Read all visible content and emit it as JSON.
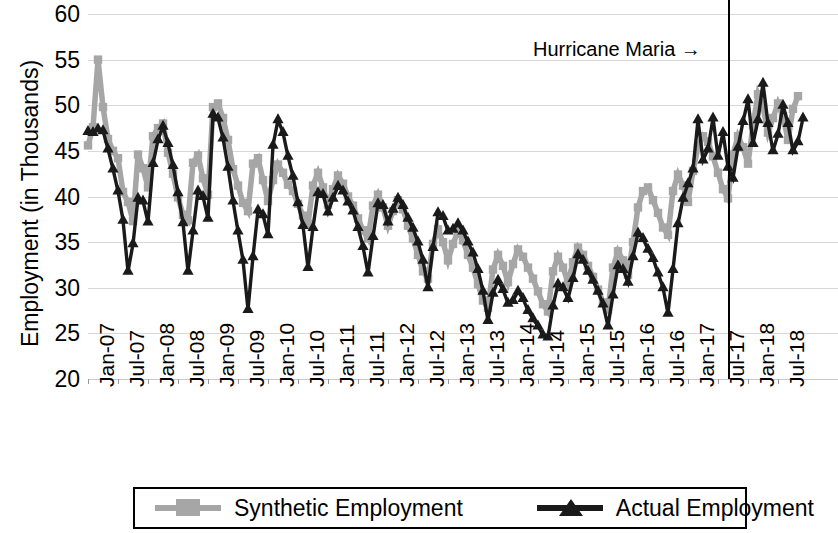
{
  "chart_data": {
    "type": "line",
    "title": "",
    "xlabel": "",
    "ylabel": "Employment (in Thousands)",
    "ylim": [
      20,
      60
    ],
    "yticks": [
      20,
      25,
      30,
      35,
      40,
      45,
      50,
      55,
      60
    ],
    "grid": true,
    "legend_position": "bottom",
    "annotations": [
      {
        "text": "Hurricane Maria →",
        "x": "Sep-17",
        "type": "vertical-line-label"
      }
    ],
    "event_line": {
      "label": "Hurricane Maria",
      "x_index": 128,
      "x_label": "Sep-17"
    },
    "x_tick_labels": [
      "Jan-07",
      "Jul-07",
      "Jan-08",
      "Jul-08",
      "Jan-09",
      "Jul-09",
      "Jan-10",
      "Jul-10",
      "Jan-11",
      "Jul-11",
      "Jan-12",
      "Jul-12",
      "Jan-13",
      "Jul-13",
      "Jan-14",
      "Jul-14",
      "Jan-15",
      "Jul-15",
      "Jan-16",
      "Jul-16",
      "Jan-17",
      "Jul-17",
      "Jan-18",
      "Jul-18"
    ],
    "x_tick_step_months": 6,
    "x_start": "Jan-07",
    "x_end": "Jul-18",
    "n_points": 139,
    "series": [
      {
        "name": "Synthetic Employment",
        "color": "#a6a6a6",
        "marker": "square",
        "values": [
          45.6,
          47.6,
          55.0,
          49.8,
          46.3,
          45.0,
          44.2,
          40.5,
          39.4,
          37.3,
          44.6,
          43.1,
          41.0,
          46.6,
          47.5,
          48.0,
          44.8,
          42.5,
          39.9,
          38.0,
          37.4,
          43.7,
          44.5,
          42.0,
          40.2,
          49.8,
          50.2,
          48.6,
          46.2,
          43.0,
          41.2,
          39.3,
          38.4,
          43.6,
          44.2,
          41.8,
          39.5,
          41.8,
          43.5,
          42.6,
          41.3,
          40.6,
          39.2,
          37.9,
          37.0,
          41.2,
          42.6,
          41.0,
          39.1,
          40.8,
          42.3,
          41.4,
          40.0,
          39.0,
          37.6,
          36.3,
          35.4,
          39.0,
          40.2,
          38.8,
          36.8,
          38.4,
          39.6,
          38.6,
          36.8,
          35.4,
          33.6,
          31.8,
          31.0,
          34.8,
          36.4,
          35.0,
          33.0,
          34.8,
          36.2,
          35.2,
          33.6,
          32.2,
          30.4,
          28.6,
          27.8,
          32.0,
          33.6,
          32.4,
          30.6,
          32.6,
          34.2,
          33.4,
          32.2,
          31.0,
          29.6,
          28.2,
          27.4,
          31.8,
          33.4,
          32.2,
          30.6,
          32.8,
          34.4,
          33.6,
          32.4,
          31.2,
          29.8,
          28.4,
          27.6,
          32.2,
          34.0,
          33.0,
          31.4,
          35.0,
          38.8,
          40.6,
          41.0,
          39.6,
          38.2,
          36.6,
          35.8,
          40.6,
          42.4,
          41.2,
          39.4,
          42.8,
          45.4,
          46.6,
          46.0,
          44.4,
          42.6,
          40.8,
          39.8,
          44.6,
          46.6,
          45.4,
          43.6,
          47.8,
          51.2,
          49.8,
          47.0,
          48.6,
          50.2,
          48.8,
          46.2,
          49.6,
          51.0
        ]
      },
      {
        "name": "Actual Employment",
        "color": "#1a1a1a",
        "marker": "triangle",
        "values": [
          47.1,
          47.0,
          47.4,
          47.2,
          45.2,
          43.0,
          40.6,
          37.4,
          31.8,
          34.8,
          39.8,
          39.5,
          37.2,
          43.6,
          46.2,
          47.7,
          45.8,
          43.4,
          40.4,
          37.1,
          31.8,
          36.2,
          40.6,
          40.0,
          37.6,
          49.0,
          48.6,
          46.4,
          43.2,
          39.5,
          36.2,
          33.0,
          27.6,
          33.4,
          38.5,
          38.0,
          35.8,
          45.6,
          48.4,
          47.0,
          44.4,
          42.2,
          39.3,
          36.8,
          32.2,
          36.6,
          40.4,
          40.2,
          38.3,
          39.8,
          41.1,
          40.6,
          39.4,
          38.4,
          36.6,
          34.5,
          31.6,
          35.6,
          39.2,
          39.0,
          37.2,
          38.6,
          39.8,
          39.0,
          37.6,
          36.5,
          35.0,
          33.0,
          30.0,
          34.4,
          38.2,
          37.8,
          36.2,
          36.4,
          37.0,
          36.2,
          35.0,
          33.8,
          32.0,
          29.6,
          26.4,
          29.4,
          30.8,
          29.8,
          28.3,
          28.6,
          29.6,
          28.8,
          27.5,
          26.6,
          25.8,
          24.8,
          24.6,
          28.0,
          30.4,
          30.0,
          28.8,
          31.0,
          33.6,
          33.0,
          31.8,
          30.8,
          29.6,
          28.2,
          25.8,
          29.2,
          32.4,
          32.0,
          30.6,
          33.4,
          36.0,
          35.4,
          34.2,
          33.2,
          31.6,
          30.0,
          27.2,
          32.0,
          37.0,
          39.8,
          41.4,
          43.0,
          48.4,
          44.0,
          45.2,
          48.6,
          44.4,
          47.0,
          43.2,
          42.0,
          45.4,
          48.2,
          50.6,
          45.8,
          48.4,
          52.4,
          48.0,
          45.0,
          46.8,
          50.0,
          48.0,
          45.0,
          46.0,
          48.6
        ]
      }
    ]
  },
  "legend": {
    "items": [
      {
        "label": "Synthetic Employment",
        "color": "#a6a6a6",
        "marker": "square"
      },
      {
        "label": "Actual Employment",
        "color": "#1a1a1a",
        "marker": "triangle"
      }
    ]
  },
  "axis": {
    "y_title": "Employment (in Thousands)",
    "y_ticks": [
      "60",
      "55",
      "50",
      "45",
      "40",
      "35",
      "30",
      "25",
      "20"
    ],
    "x_ticks": [
      "Jan-07",
      "Jul-07",
      "Jan-08",
      "Jul-08",
      "Jan-09",
      "Jul-09",
      "Jan-10",
      "Jul-10",
      "Jan-11",
      "Jul-11",
      "Jan-12",
      "Jul-12",
      "Jan-13",
      "Jul-13",
      "Jan-14",
      "Jul-14",
      "Jan-15",
      "Jul-15",
      "Jan-16",
      "Jul-16",
      "Jan-17",
      "Jul-17",
      "Jan-18",
      "Jul-18"
    ]
  },
  "annotation": {
    "hurricane_label": "Hurricane Maria →"
  }
}
